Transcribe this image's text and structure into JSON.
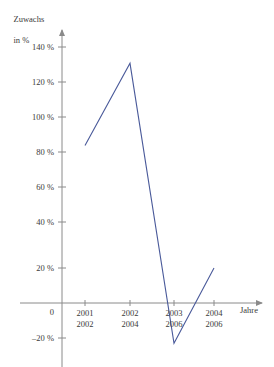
{
  "chart_data": {
    "type": "line",
    "title": "",
    "subtitle": "",
    "ylabel_line1": "Zuwachs",
    "ylabel_line2": "in %",
    "xlabel": "Jahre",
    "grid": false,
    "legend": "none",
    "ylim": [
      -20,
      140
    ],
    "y_ticks": [
      -20,
      20,
      40,
      60,
      80,
      100,
      120,
      140
    ],
    "y_tick_labels": [
      "–20 %",
      "20 %",
      "40 %",
      "60 %",
      "80 %",
      "100 %",
      "120 %",
      "140 %"
    ],
    "zero_label": "0",
    "categories": [
      "2001",
      "2002",
      "2003",
      "2004"
    ],
    "categories_row2": [
      "2002",
      "2004",
      "2006",
      "2006"
    ],
    "x_tick_labels": [
      {
        "row1": "2001",
        "row2": "2002"
      },
      {
        "row1": "2002",
        "row2": "2004"
      },
      {
        "row1": "2003",
        "row2": "2006"
      },
      {
        "row1": "2004",
        "row2": "2006"
      }
    ],
    "values": [
      90,
      137,
      -23,
      20
    ],
    "series": [
      {
        "name": "Zuwachs",
        "color": "#4a5a9a",
        "values": [
          90,
          137,
          -23,
          20
        ]
      }
    ],
    "line_color": "#4a5a9a",
    "axis_color": "#8a8a8a"
  }
}
